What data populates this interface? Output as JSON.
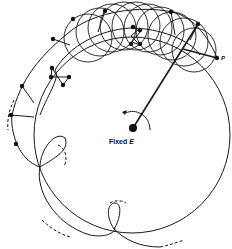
{
  "diagram": {
    "center_label": "Fixed ",
    "center_label_italic": "E",
    "point_label": "P",
    "ink_color": "#1a1a1a",
    "background": "#ffffff"
  }
}
